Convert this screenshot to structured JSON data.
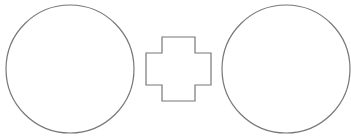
{
  "diagram": {
    "background": "#ffffff",
    "stroke_color": "#777777",
    "fill_color": "#ffffff",
    "shapes": [
      {
        "type": "circle",
        "name": "left-circle",
        "cx": 70,
        "cy": 69,
        "r": 64
      },
      {
        "type": "cross",
        "name": "center-cross",
        "points": "162,37 195,37 195,53 211,53 211,85 195,85 195,101 162,101 162,85 146,85 146,53 162,53"
      },
      {
        "type": "circle",
        "name": "right-circle",
        "cx": 286,
        "cy": 69,
        "r": 64
      }
    ]
  }
}
